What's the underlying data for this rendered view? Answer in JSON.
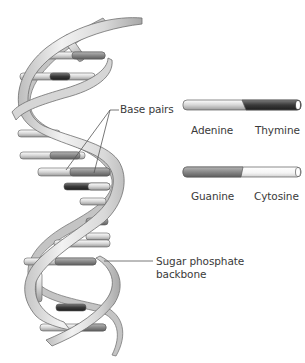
{
  "diagram": {
    "labels": {
      "base_pairs": "Base pairs",
      "backbone_line1": "Sugar phosphate",
      "backbone_line2": "backbone"
    },
    "legend": [
      {
        "left": "Adenine",
        "right": "Thymine",
        "left_color": "#e8e8e8",
        "right_color": "#3c3c3c"
      },
      {
        "left": "Guanine",
        "right": "Cytosine",
        "left_color": "#8a8a8a",
        "right_color": "#ffffff"
      }
    ],
    "colors": {
      "strand_light": "#efefef",
      "strand_mid": "#c9c9c9",
      "strand_dark": "#8f8f8f",
      "outline": "#6e6e6e",
      "leader_line": "#555555"
    }
  }
}
